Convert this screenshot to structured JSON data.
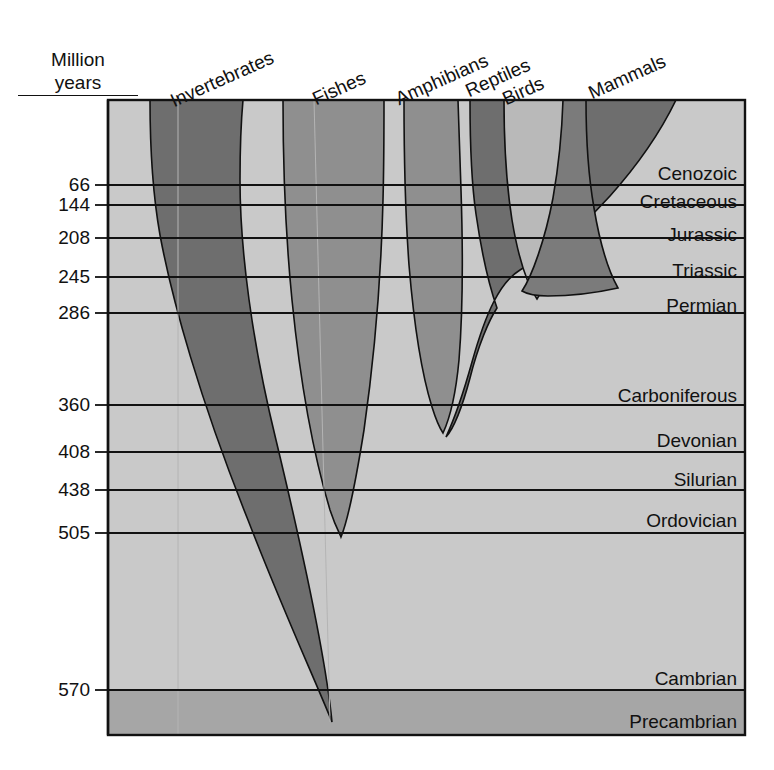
{
  "figure": {
    "kind": "evolutionary-timeline-stream-chart",
    "axis_title_line1": "Million",
    "axis_title_line2": "years"
  },
  "chart_data": {
    "type": "area",
    "xlabel": "",
    "ylabel": "Million years",
    "ylim": [
      0,
      600
    ],
    "grid": true,
    "legend": "none",
    "y_axis_direction": "inverted-time-oldest-at-bottom",
    "categories": [
      "Invertebrates",
      "Fishes",
      "Amphibians",
      "Reptiles",
      "Birds",
      "Mammals"
    ],
    "tick_labels": [
      "66",
      "144",
      "208",
      "245",
      "286",
      "360",
      "408",
      "438",
      "505",
      "570"
    ],
    "tick_values": [
      66,
      144,
      208,
      245,
      286,
      360,
      408,
      438,
      505,
      570
    ],
    "periods": [
      {
        "name": "Cenozoic",
        "start_ma": 66,
        "end_ma": 0
      },
      {
        "name": "Cretaceous",
        "start_ma": 144,
        "end_ma": 66
      },
      {
        "name": "Jurassic",
        "start_ma": 208,
        "end_ma": 144
      },
      {
        "name": "Triassic",
        "start_ma": 245,
        "end_ma": 208
      },
      {
        "name": "Permian",
        "start_ma": 286,
        "end_ma": 245
      },
      {
        "name": "Carboniferous",
        "start_ma": 360,
        "end_ma": 286
      },
      {
        "name": "Devonian",
        "start_ma": 408,
        "end_ma": 360
      },
      {
        "name": "Silurian",
        "start_ma": 438,
        "end_ma": 408
      },
      {
        "name": "Ordovician",
        "start_ma": 505,
        "end_ma": 438
      },
      {
        "name": "Cambrian",
        "start_ma": 570,
        "end_ma": 505
      },
      {
        "name": "Precambrian",
        "start_ma": 650,
        "end_ma": 570
      }
    ],
    "series": [
      {
        "name": "Invertebrates",
        "first_appearance_ma": 600,
        "present_today": true
      },
      {
        "name": "Fishes",
        "first_appearance_ma": 505,
        "present_today": true
      },
      {
        "name": "Amphibians",
        "first_appearance_ma": 360,
        "present_today": true
      },
      {
        "name": "Reptiles",
        "first_appearance_ma": 320,
        "present_today": true
      },
      {
        "name": "Birds",
        "first_appearance_ma": 208,
        "present_today": true
      },
      {
        "name": "Mammals",
        "first_appearance_ma": 225,
        "present_today": true
      }
    ]
  },
  "colors": {
    "background_light": "#c9c9c9",
    "precambrian": "#a6a6a6",
    "stream_dark": "#6e6e6e",
    "stream_mid": "#8f8f8f",
    "stream_light": "#b9b9b9",
    "page": "#ffffff",
    "ink": "#111111"
  },
  "ticks": [
    {
      "label": "66",
      "y": 185
    },
    {
      "label": "144",
      "y": 205
    },
    {
      "label": "208",
      "y": 238
    },
    {
      "label": "245",
      "y": 277
    },
    {
      "label": "286",
      "y": 313
    },
    {
      "label": "360",
      "y": 405
    },
    {
      "label": "408",
      "y": 452
    },
    {
      "label": "438",
      "y": 490
    },
    {
      "label": "505",
      "y": 533
    },
    {
      "label": "570",
      "y": 690
    }
  ],
  "period_labels": [
    {
      "label": "Cenozoic",
      "y": 174
    },
    {
      "label": "Cretaceous",
      "y": 202
    },
    {
      "label": "Jurassic",
      "y": 235
    },
    {
      "label": "Triassic",
      "y": 271
    },
    {
      "label": "Permian",
      "y": 306
    },
    {
      "label": "Carboniferous",
      "y": 396
    },
    {
      "label": "Devonian",
      "y": 441
    },
    {
      "label": "Silurian",
      "y": 480
    },
    {
      "label": "Ordovician",
      "y": 521
    },
    {
      "label": "Cambrian",
      "y": 679
    },
    {
      "label": "Precambrian",
      "y": 722
    }
  ],
  "column_headers": [
    {
      "label": "Invertebrates",
      "x": 176,
      "y": 90
    },
    {
      "label": "Fishes",
      "x": 318,
      "y": 88
    },
    {
      "label": "Amphibians",
      "x": 401,
      "y": 88
    },
    {
      "label": "Reptiles",
      "x": 471,
      "y": 80
    },
    {
      "label": "Birds",
      "x": 508,
      "y": 88
    },
    {
      "label": "Mammals",
      "x": 594,
      "y": 82
    }
  ]
}
